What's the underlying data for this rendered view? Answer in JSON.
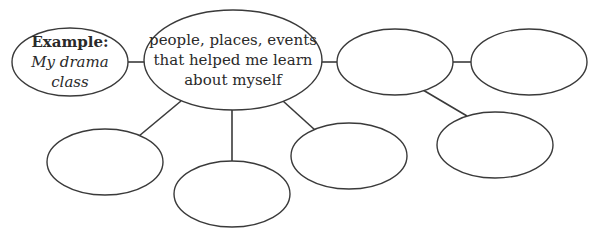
{
  "diagram": {
    "type": "web-organizer",
    "stroke_color": "#3a3a3a",
    "background": "#ffffff",
    "example_node": {
      "label": "Example:",
      "value_line1": "My drama",
      "value_line2": "class"
    },
    "center_node": {
      "line1": "people, places, events",
      "line2": "that helped me learn",
      "line3": "about myself"
    },
    "nodes": [
      {
        "id": "example",
        "cx": 70,
        "cy": 62,
        "rx": 58,
        "ry": 34,
        "text": "Example: My drama class"
      },
      {
        "id": "center",
        "cx": 233,
        "cy": 60,
        "rx": 89,
        "ry": 50,
        "text": "people, places, events that helped me learn about myself"
      },
      {
        "id": "right-1",
        "cx": 395,
        "cy": 62,
        "rx": 58,
        "ry": 33,
        "text": ""
      },
      {
        "id": "right-2",
        "cx": 529,
        "cy": 62,
        "rx": 58,
        "ry": 33,
        "text": ""
      },
      {
        "id": "right-lower",
        "cx": 495,
        "cy": 145,
        "rx": 58,
        "ry": 33,
        "text": ""
      },
      {
        "id": "bottom-left",
        "cx": 105,
        "cy": 162,
        "rx": 58,
        "ry": 33,
        "text": ""
      },
      {
        "id": "bottom-middle",
        "cx": 232,
        "cy": 194,
        "rx": 58,
        "ry": 33,
        "text": ""
      },
      {
        "id": "bottom-right",
        "cx": 349,
        "cy": 156,
        "rx": 58,
        "ry": 33,
        "text": ""
      }
    ],
    "edges": [
      {
        "from": "example",
        "to": "center"
      },
      {
        "from": "center",
        "to": "right-1"
      },
      {
        "from": "right-1",
        "to": "right-2"
      },
      {
        "from": "right-1",
        "to": "right-lower"
      },
      {
        "from": "center",
        "to": "bottom-left"
      },
      {
        "from": "center",
        "to": "bottom-middle"
      },
      {
        "from": "center",
        "to": "bottom-right"
      }
    ]
  }
}
